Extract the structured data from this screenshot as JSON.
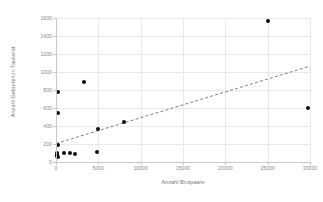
{
  "chart_data": {
    "type": "scatter",
    "title": "",
    "xlabel": "Anzahl Brutpaare",
    "ylabel": "Anzahl Geburten in Tausend",
    "xlim": [
      0,
      30000
    ],
    "ylim": [
      0,
      1600
    ],
    "xticks": [
      0,
      5000,
      10000,
      15000,
      20000,
      25000,
      30000
    ],
    "xtick_labels": [
      "0",
      "5000",
      "10000",
      "15000",
      "20000",
      "25000",
      "30000"
    ],
    "yticks": [
      0,
      200,
      400,
      600,
      800,
      1000,
      1200,
      1400,
      1600
    ],
    "ytick_labels": [
      "0",
      "200",
      "400",
      "600",
      "800",
      "1000",
      "1200",
      "1400",
      "1600"
    ],
    "grid": true,
    "legend": "none",
    "marker_color": "#101010",
    "gridline_color": "#e8e8e8",
    "axis_color": "#c9c9c9",
    "tick_label_color": "#8a8a8a",
    "points": [
      {
        "x": 100,
        "y": 83
      },
      {
        "x": 120,
        "y": 63
      },
      {
        "x": 140,
        "y": 100
      },
      {
        "x": 160,
        "y": 72
      },
      {
        "x": 180,
        "y": 55
      },
      {
        "x": 200,
        "y": 190
      },
      {
        "x": 230,
        "y": 780
      },
      {
        "x": 250,
        "y": 550
      },
      {
        "x": 900,
        "y": 95
      },
      {
        "x": 1700,
        "y": 100
      },
      {
        "x": 2300,
        "y": 90
      },
      {
        "x": 3300,
        "y": 890
      },
      {
        "x": 4800,
        "y": 110
      },
      {
        "x": 5000,
        "y": 370
      },
      {
        "x": 8000,
        "y": 440
      },
      {
        "x": 25000,
        "y": 1570
      },
      {
        "x": 29800,
        "y": 600
      }
    ],
    "trendline": {
      "style": "dashed",
      "color": "#6f6f6f",
      "x_start": 0,
      "y_start": 205,
      "x_end": 30000,
      "y_end": 1065
    }
  }
}
